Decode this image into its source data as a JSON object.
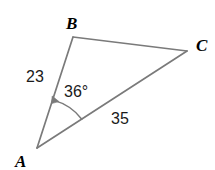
{
  "figure": {
    "kind": "triangle-diagram",
    "background_color": "#ffffff",
    "stroke_color": "#7a7a7a",
    "stroke_width": 1.7,
    "text_color": "#1a1a1a",
    "vertices": [
      {
        "name": "A",
        "label": "A",
        "x": 37,
        "y": 148,
        "label_x": 15,
        "label_y": 167
      },
      {
        "name": "B",
        "label": "B",
        "x": 73,
        "y": 37,
        "label_x": 66,
        "label_y": 29
      },
      {
        "name": "C",
        "label": "C",
        "x": 187,
        "y": 51,
        "label_x": 196,
        "label_y": 51
      }
    ],
    "sides": [
      {
        "name": "AB",
        "from": "A",
        "to": "B",
        "label": "23",
        "label_x": 26,
        "label_y": 82
      },
      {
        "name": "BC",
        "from": "B",
        "to": "C",
        "label": "",
        "label_x": 0,
        "label_y": 0
      },
      {
        "name": "AC",
        "from": "A",
        "to": "C",
        "label": "35",
        "label_x": 111,
        "label_y": 124
      }
    ],
    "angle": {
      "at_vertex": "A",
      "label": "36°",
      "value": 36,
      "unit": "degrees",
      "label_x": 64,
      "label_y": 97,
      "arc_radius": 53,
      "arrow_at": "AB-side"
    }
  }
}
